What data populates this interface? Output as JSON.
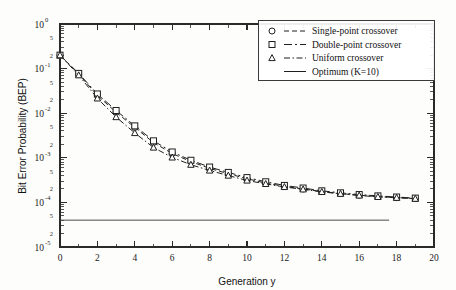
{
  "chart_data": {
    "type": "line",
    "title": "",
    "xlabel": "Generation y",
    "ylabel": "Bit Error Probability (BEP)",
    "xlim": [
      0,
      20
    ],
    "ylim": [
      1e-05,
      1
    ],
    "yscale": "log",
    "grid": false,
    "legend_position": "top-right",
    "x_ticks": [
      0,
      2,
      4,
      6,
      8,
      10,
      12,
      14,
      16,
      18,
      20
    ],
    "x_tick_labels": [
      "0",
      "2",
      "4",
      "6",
      "8",
      "10",
      "12",
      "14",
      "16",
      "18",
      "20"
    ],
    "y_ticks": [
      1,
      0.1,
      0.01,
      0.001,
      0.0001,
      1e-05
    ],
    "y_tick_labels": [
      "10",
      "10",
      "10",
      "10",
      "10",
      "10"
    ],
    "y_tick_exponents": [
      "0",
      "-1",
      "-2",
      "-3",
      "-4",
      "-5"
    ],
    "y_minor_labels": [
      "5",
      "2"
    ],
    "x": [
      0,
      1,
      2,
      3,
      4,
      5,
      6,
      7,
      8,
      9,
      10,
      11,
      12,
      13,
      14,
      15,
      16,
      17,
      18,
      19
    ],
    "series": [
      {
        "name": "Single-point crossover",
        "marker": "circle",
        "linestyle": "dashed",
        "values": [
          0.2,
          0.075,
          0.025,
          0.0105,
          0.0048,
          0.0022,
          0.00125,
          0.00082,
          0.00058,
          0.00044,
          0.00034,
          0.00027,
          0.00023,
          0.0002,
          0.000175,
          0.000158,
          0.000145,
          0.000135,
          0.000128,
          0.000122
        ]
      },
      {
        "name": "Double-point crossover",
        "marker": "square",
        "linestyle": "dashdot-long",
        "values": [
          0.2,
          0.078,
          0.027,
          0.0115,
          0.0052,
          0.0024,
          0.00135,
          0.00088,
          0.00062,
          0.00047,
          0.00036,
          0.00029,
          0.00024,
          0.00021,
          0.000182,
          0.000164,
          0.00015,
          0.00014,
          0.000132,
          0.000125
        ]
      },
      {
        "name": "Uniform crossover",
        "marker": "triangle",
        "linestyle": "dashdot",
        "values": [
          0.2,
          0.071,
          0.0215,
          0.0082,
          0.0036,
          0.0017,
          0.00102,
          0.0007,
          0.00052,
          0.0004,
          0.00031,
          0.00026,
          0.000222,
          0.000196,
          0.000172,
          0.000156,
          0.000143,
          0.000133,
          0.000127,
          0.000121
        ]
      },
      {
        "name": "Optimum (K=10)",
        "marker": "none",
        "linestyle": "solid",
        "constant_value": 4e-05,
        "x_range": [
          0,
          17.6
        ]
      }
    ],
    "legend_entries": [
      {
        "label": "Single-point crossover",
        "marker": "circle",
        "linestyle": "dashed"
      },
      {
        "label": "Double-point crossover",
        "marker": "square",
        "linestyle": "dashdot-long"
      },
      {
        "label": "Uniform crossover",
        "marker": "triangle",
        "linestyle": "dashdot"
      },
      {
        "label": "Optimum (K=10)",
        "marker": "none",
        "linestyle": "solid"
      }
    ]
  },
  "colors": {
    "line": "#1f1f1f",
    "optimum": "#4b4b4b",
    "axis": "#2a2a2a",
    "background": "#fdfdfc"
  }
}
